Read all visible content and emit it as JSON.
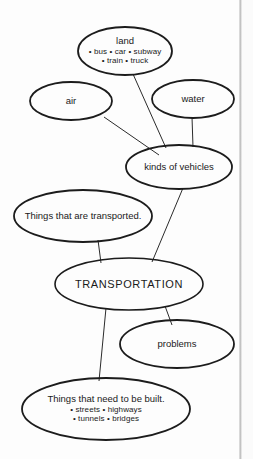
{
  "diagram": {
    "type": "concept-map",
    "center_topic": "TRANSPORTATION",
    "nodes": [
      {
        "id": "land",
        "title": "land",
        "sub": [
          "• bus  • car  • subway",
          "• train  • truck"
        ]
      },
      {
        "id": "air",
        "title": "air",
        "sub": []
      },
      {
        "id": "water",
        "title": "water",
        "sub": []
      },
      {
        "id": "kinds",
        "title": "kinds of vehicles",
        "sub": []
      },
      {
        "id": "transported",
        "title": "Things that are transported.",
        "sub": []
      },
      {
        "id": "transportation",
        "title": "TRANSPORTATION",
        "sub": []
      },
      {
        "id": "problems",
        "title": "problems",
        "sub": []
      },
      {
        "id": "built",
        "title": "Things that need to be built.",
        "sub": [
          "• streets  • highways",
          "• tunnels  • bridges"
        ]
      }
    ],
    "edges": [
      {
        "from": "land",
        "to": "kinds"
      },
      {
        "from": "air",
        "to": "kinds"
      },
      {
        "from": "water",
        "to": "kinds"
      },
      {
        "from": "kinds",
        "to": "transportation"
      },
      {
        "from": "transported",
        "to": "transportation"
      },
      {
        "from": "transportation",
        "to": "problems"
      },
      {
        "from": "transportation",
        "to": "built"
      }
    ],
    "colors": {
      "ellipse_stroke": "#1c1c1c",
      "connector_stroke": "#2b2b2b",
      "text": "#1a1a1a",
      "background": "#fdfdfd",
      "gutter": "#bdbdbd"
    }
  }
}
